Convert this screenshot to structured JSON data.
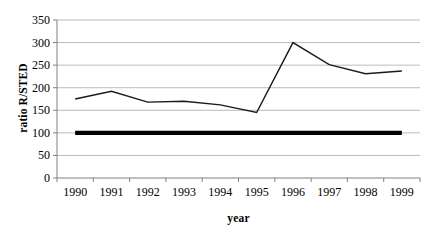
{
  "chart_data": {
    "type": "line",
    "title": "",
    "xlabel": "year",
    "ylabel": "ratio R/STED",
    "categories": [
      "1990",
      "1991",
      "1992",
      "1993",
      "1994",
      "1995",
      "1996",
      "1997",
      "1998",
      "1999"
    ],
    "x": [
      1990,
      1991,
      1992,
      1993,
      1994,
      1995,
      1996,
      1997,
      1998,
      1999
    ],
    "series": [
      {
        "name": "ratio R/STED",
        "values": [
          175,
          192,
          168,
          170,
          162,
          145,
          300,
          251,
          231,
          237
        ],
        "color": "#1a1a1a",
        "line_width": 1.4
      },
      {
        "name": "reference line",
        "values": [
          100,
          100,
          100,
          100,
          100,
          100,
          100,
          100,
          100,
          100
        ],
        "color": "#000000",
        "line_width": 4.2
      }
    ],
    "ylim": [
      0,
      350
    ],
    "ytick_values": [
      0,
      50,
      100,
      150,
      200,
      250,
      300,
      350
    ],
    "ytick_labels": [
      "0",
      "50",
      "100",
      "150",
      "200",
      "250",
      "300",
      "350"
    ],
    "xlim": [
      1989.5,
      1999.5
    ],
    "grid": "horizontal",
    "grid_color": "#a9a9a9",
    "axis_color": "#808080",
    "legend": "none",
    "background": "#ffffff"
  },
  "axes": {
    "plot_left": 57,
    "plot_right": 420,
    "plot_top": 20,
    "plot_bottom": 178
  }
}
